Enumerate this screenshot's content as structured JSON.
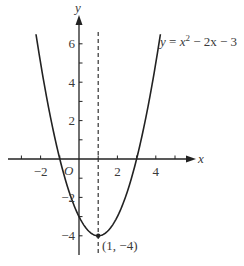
{
  "chart_data": {
    "type": "line",
    "title": "",
    "function": "y = x^2 - 2x - 3",
    "equation_label": {
      "y": "y",
      "eq": " = ",
      "x": "x",
      "sup": "2",
      "rest": " − 2x − 3"
    },
    "xlabel": "x",
    "ylabel": "y",
    "origin_label": "O",
    "xlim": [
      -3.8,
      6.0
    ],
    "ylim": [
      -5.0,
      7.5
    ],
    "x_ticks": [
      -3,
      -2,
      -1,
      1,
      2,
      3,
      4,
      5
    ],
    "x_tick_labels": [
      {
        "value": -2,
        "label": "−2"
      },
      {
        "value": 2,
        "label": "2"
      },
      {
        "value": 4,
        "label": "4"
      }
    ],
    "y_ticks": [
      6,
      5,
      4,
      3,
      2,
      1,
      -1,
      -2,
      -3,
      -4
    ],
    "y_tick_labels": [
      {
        "value": 6,
        "label": "6"
      },
      {
        "value": 4,
        "label": "4"
      },
      {
        "value": 2,
        "label": "2"
      },
      {
        "value": -2,
        "label": "−2"
      },
      {
        "value": -4,
        "label": "−4"
      }
    ],
    "axis_of_symmetry": {
      "x": 1,
      "style": "dashed"
    },
    "vertex": {
      "x": 1,
      "y": -4,
      "label": "(1, −4)"
    },
    "series": [
      {
        "name": "y = x^2 - 2x - 3",
        "x": [
          -2.24,
          -2,
          -1,
          0,
          1,
          2,
          3,
          4,
          4.24
        ],
        "y": [
          6.5,
          5,
          0,
          -3,
          -4,
          -3,
          0,
          5,
          6.5
        ]
      }
    ],
    "grid": false,
    "legend": "none"
  }
}
